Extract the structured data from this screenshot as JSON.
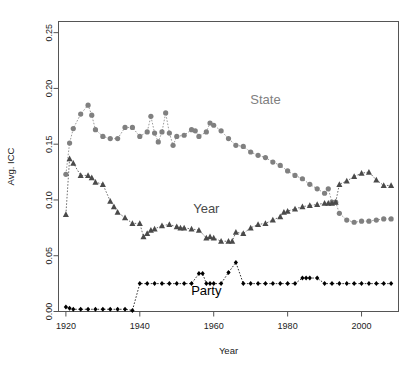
{
  "chart_data": {
    "type": "scatter",
    "title": "",
    "xlabel": "Year",
    "ylabel": "Avg. ICC",
    "xlim": [
      1918,
      2010
    ],
    "ylim": [
      0.0,
      0.26
    ],
    "grid": false,
    "legend_position": "inline-annotations",
    "x_ticks": [
      1920,
      1940,
      1960,
      1980,
      2000
    ],
    "y_ticks": [
      0.0,
      0.05,
      0.1,
      0.15,
      0.2,
      0.25
    ],
    "y_tick_labels": [
      "0.00",
      "0.05",
      "0.10",
      "0.15",
      "0.20",
      "0.25"
    ],
    "x_tick_labels": [
      "1920",
      "1940",
      "1960",
      "1980",
      "2000"
    ],
    "series": [
      {
        "name": "State",
        "color": "#808080",
        "marker": "circle",
        "label_x": 1974,
        "label_y": 0.186,
        "x": [
          1920,
          1921,
          1922,
          1924,
          1926,
          1927,
          1928,
          1930,
          1932,
          1934,
          1936,
          1938,
          1940,
          1942,
          1943,
          1944,
          1945,
          1946,
          1947,
          1948,
          1949,
          1950,
          1952,
          1954,
          1955,
          1956,
          1958,
          1959,
          1960,
          1962,
          1964,
          1966,
          1968,
          1970,
          1972,
          1974,
          1976,
          1978,
          1980,
          1982,
          1984,
          1986,
          1988,
          1990,
          1991,
          1992,
          1993,
          1994,
          1996,
          1998,
          2000,
          2002,
          2004,
          2006,
          2008
        ],
        "y": [
          0.123,
          0.151,
          0.164,
          0.177,
          0.185,
          0.176,
          0.163,
          0.157,
          0.155,
          0.155,
          0.165,
          0.165,
          0.157,
          0.161,
          0.175,
          0.16,
          0.152,
          0.161,
          0.178,
          0.16,
          0.149,
          0.157,
          0.158,
          0.163,
          0.162,
          0.157,
          0.161,
          0.169,
          0.167,
          0.162,
          0.155,
          0.149,
          0.148,
          0.143,
          0.14,
          0.138,
          0.134,
          0.131,
          0.126,
          0.122,
          0.119,
          0.114,
          0.11,
          0.106,
          0.11,
          0.098,
          0.098,
          0.088,
          0.082,
          0.08,
          0.081,
          0.081,
          0.082,
          0.083,
          0.083
        ]
      },
      {
        "name": "Year",
        "color": "#4a4a4a",
        "marker": "triangle",
        "label_x": 1958,
        "label_y": 0.088,
        "x": [
          1920,
          1921,
          1922,
          1924,
          1926,
          1927,
          1928,
          1930,
          1932,
          1933,
          1934,
          1936,
          1938,
          1940,
          1941,
          1942,
          1943,
          1944,
          1946,
          1948,
          1950,
          1951,
          1952,
          1954,
          1956,
          1958,
          1959,
          1960,
          1962,
          1964,
          1965,
          1966,
          1968,
          1970,
          1972,
          1974,
          1976,
          1978,
          1979,
          1980,
          1982,
          1984,
          1986,
          1988,
          1990,
          1991,
          1992,
          1993,
          1994,
          1996,
          1998,
          2000,
          2002,
          2004,
          2006,
          2008
        ],
        "y": [
          0.087,
          0.137,
          0.133,
          0.122,
          0.122,
          0.12,
          0.116,
          0.114,
          0.099,
          0.094,
          0.089,
          0.084,
          0.079,
          0.079,
          0.067,
          0.07,
          0.073,
          0.074,
          0.077,
          0.078,
          0.076,
          0.075,
          0.075,
          0.074,
          0.073,
          0.066,
          0.067,
          0.066,
          0.063,
          0.063,
          0.063,
          0.071,
          0.07,
          0.075,
          0.078,
          0.079,
          0.082,
          0.085,
          0.089,
          0.09,
          0.092,
          0.094,
          0.095,
          0.096,
          0.097,
          0.097,
          0.097,
          0.098,
          0.114,
          0.117,
          0.121,
          0.124,
          0.125,
          0.118,
          0.113,
          0.113
        ]
      },
      {
        "name": "Party",
        "color": "#000000",
        "marker": "diamond",
        "label_x": 1958,
        "label_y": 0.015,
        "x": [
          1920,
          1921,
          1922,
          1924,
          1926,
          1928,
          1930,
          1932,
          1934,
          1936,
          1938,
          1940,
          1942,
          1944,
          1946,
          1948,
          1950,
          1952,
          1954,
          1956,
          1957,
          1958,
          1959,
          1960,
          1962,
          1964,
          1966,
          1968,
          1970,
          1972,
          1974,
          1976,
          1978,
          1980,
          1982,
          1984,
          1985,
          1986,
          1988,
          1990,
          1992,
          1994,
          1996,
          1998,
          2000,
          2002,
          2004,
          2006,
          2008
        ],
        "y": [
          0.004,
          0.003,
          0.002,
          0.002,
          0.002,
          0.002,
          0.002,
          0.002,
          0.002,
          0.002,
          0.001,
          0.025,
          0.025,
          0.025,
          0.025,
          0.025,
          0.025,
          0.025,
          0.025,
          0.034,
          0.034,
          0.025,
          0.025,
          0.025,
          0.025,
          0.035,
          0.044,
          0.025,
          0.025,
          0.025,
          0.025,
          0.025,
          0.025,
          0.025,
          0.025,
          0.03,
          0.03,
          0.03,
          0.03,
          0.025,
          0.025,
          0.025,
          0.025,
          0.025,
          0.025,
          0.025,
          0.025,
          0.025,
          0.025
        ]
      }
    ]
  }
}
